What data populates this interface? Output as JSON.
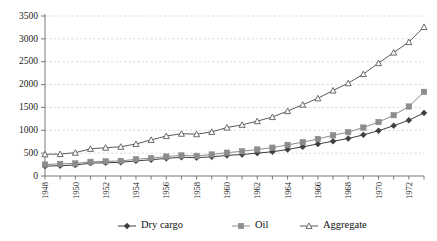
{
  "chart_data": {
    "type": "line",
    "title": "",
    "subtitle": "",
    "xlabel": "",
    "ylabel": "",
    "xlim": [
      1948,
      1973
    ],
    "ylim": [
      0,
      3500
    ],
    "grid": true,
    "legend_position": "bottom",
    "x": [
      1948,
      1949,
      1950,
      1951,
      1952,
      1953,
      1954,
      1955,
      1956,
      1957,
      1958,
      1959,
      1960,
      1961,
      1962,
      1963,
      1964,
      1965,
      1966,
      1967,
      1968,
      1969,
      1970,
      1971,
      1972,
      1973
    ],
    "xticks": [
      "1948",
      "1950",
      "1952",
      "1954",
      "1956",
      "1958",
      "1960",
      "1962",
      "1964",
      "1966",
      "1968",
      "1970",
      "1972"
    ],
    "yticks": [
      "0",
      "500",
      "1000",
      "1500",
      "2000",
      "2500",
      "3000",
      "3500"
    ],
    "series": [
      {
        "name": "Dry cargo",
        "marker": "diamond",
        "color": "#3f3f3f",
        "values": [
          215,
          225,
          240,
          280,
          290,
          300,
          330,
          355,
          385,
          410,
          400,
          420,
          450,
          470,
          500,
          530,
          580,
          640,
          700,
          760,
          820,
          900,
          990,
          1100,
          1220,
          1380
        ]
      },
      {
        "name": "Oil",
        "marker": "square",
        "color": "#8c8c8c",
        "values": [
          250,
          265,
          275,
          310,
          320,
          330,
          365,
          390,
          425,
          450,
          440,
          470,
          510,
          540,
          580,
          620,
          680,
          740,
          810,
          890,
          960,
          1060,
          1180,
          1330,
          1520,
          1840
        ]
      },
      {
        "name": "Aggregate",
        "marker": "triangle-open",
        "color": "#5a5a5a",
        "values": [
          475,
          480,
          510,
          595,
          620,
          640,
          700,
          790,
          875,
          925,
          915,
          965,
          1060,
          1120,
          1200,
          1290,
          1420,
          1560,
          1700,
          1870,
          2030,
          2230,
          2470,
          2700,
          2930,
          3260
        ]
      }
    ]
  },
  "legend": {
    "items": [
      {
        "label": "Dry cargo"
      },
      {
        "label": "Oil"
      },
      {
        "label": "Aggregate"
      }
    ]
  }
}
